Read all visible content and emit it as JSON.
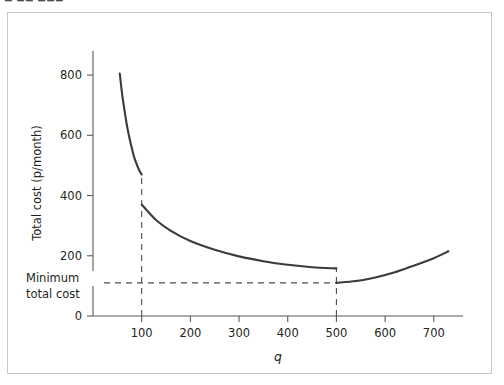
{
  "page": {
    "top_fragment": "▬ ▬▬ ▬▬▬"
  },
  "chart_data": {
    "type": "line",
    "title": "",
    "subtitle": "",
    "xlabel": "q",
    "ylabel": "Total cost (p/month)",
    "xlim": [
      0,
      760
    ],
    "ylim": [
      0,
      880
    ],
    "xticks": [
      100,
      200,
      300,
      400,
      500,
      600,
      700
    ],
    "xtick_labels": [
      "100",
      "200",
      "300",
      "400",
      "500",
      "600",
      "700"
    ],
    "yticks": [
      0,
      200,
      400,
      600,
      800
    ],
    "ytick_labels": [
      "0",
      "200",
      "400",
      "600",
      "800"
    ],
    "grid": false,
    "legend": null,
    "annotations": [
      {
        "name": "minimum-total-cost-label",
        "text_line1": "Minimum",
        "text_line2": "total cost",
        "x": 105,
        "y": 110,
        "note": "labels the horizontal dashed line marking the lowest attainable total cost"
      }
    ],
    "reference_lines": [
      {
        "name": "minimum-cost-horizontal",
        "orientation": "horizontal",
        "y": 110,
        "x_from": 0,
        "x_to": 500,
        "style": "dashed"
      },
      {
        "name": "q100-vertical",
        "orientation": "vertical",
        "x": 100,
        "y_from": 0,
        "y_to": 470,
        "style": "dashed"
      },
      {
        "name": "q500-vertical",
        "orientation": "vertical",
        "x": 500,
        "y_from": 0,
        "y_to": 158,
        "style": "dashed"
      }
    ],
    "series": [
      {
        "name": "Total cost branch 1 (q < 100)",
        "points": [
          [
            55,
            805
          ],
          [
            60,
            735
          ],
          [
            65,
            680
          ],
          [
            70,
            630
          ],
          [
            75,
            590
          ],
          [
            80,
            556
          ],
          [
            85,
            525
          ],
          [
            90,
            503
          ],
          [
            95,
            484
          ],
          [
            100,
            470
          ]
        ]
      },
      {
        "name": "Total cost branch 2 (100 ≤ q < 500)",
        "points": [
          [
            100,
            370
          ],
          [
            130,
            318
          ],
          [
            160,
            283
          ],
          [
            200,
            249
          ],
          [
            250,
            220
          ],
          [
            300,
            198
          ],
          [
            350,
            182
          ],
          [
            400,
            170
          ],
          [
            450,
            162
          ],
          [
            500,
            158
          ]
        ]
      },
      {
        "name": "Total cost branch 3 (q ≥ 500)",
        "points": [
          [
            500,
            110
          ],
          [
            540,
            116
          ],
          [
            580,
            128
          ],
          [
            620,
            145
          ],
          [
            660,
            168
          ],
          [
            700,
            192
          ],
          [
            730,
            215
          ]
        ]
      }
    ]
  }
}
